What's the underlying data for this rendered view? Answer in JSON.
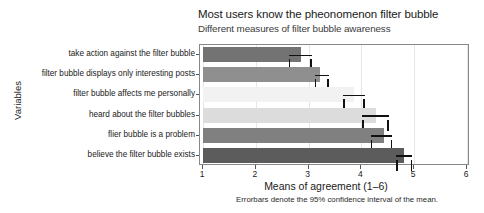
{
  "chart_data": {
    "type": "bar",
    "orientation": "horizontal",
    "title": "Most users know the pheonomenon filter bubble",
    "subtitle": "Different measures of filter bubble awareness",
    "xlabel": "Means of agreement (1–6)",
    "ylabel": "Variables",
    "caption": "Errorbars denote the 95% confidence interval of the mean.",
    "xlim": [
      1,
      6
    ],
    "xticks": [
      "1",
      "2",
      "3",
      "4",
      "5",
      "6"
    ],
    "grid": "vertical-light",
    "legend": "none",
    "categories": [
      "take action against the filter bubble",
      "filter bubble displays only interesting posts",
      "filter bubble affects me personally",
      "heard about the filter bubbles",
      "flier bubble is a problem",
      "believe the filter bubble exists"
    ],
    "values": [
      2.85,
      3.22,
      3.86,
      4.28,
      4.42,
      4.8
    ],
    "ci_low": [
      2.62,
      3.12,
      3.66,
      4.02,
      4.18,
      4.66
    ],
    "ci_high": [
      3.06,
      3.38,
      4.06,
      4.52,
      4.58,
      4.96
    ],
    "bar_colors": [
      "#737373",
      "#8f8f8f",
      "#f2f2f2",
      "#dcdcdc",
      "#808080",
      "#5c5c5c"
    ],
    "errorbar_color": "#111111",
    "panel_border_color": "#888888",
    "background_color": "#ffffff"
  }
}
